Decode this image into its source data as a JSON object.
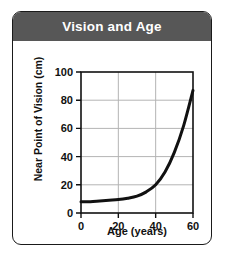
{
  "figure": {
    "title": "Vision and Age",
    "title_band_color": "#575757",
    "title_text_color": "#ffffff",
    "frame_color": "#1a1a1a",
    "background": "#ffffff"
  },
  "chart_data": {
    "type": "line",
    "title": "Vision and Age",
    "xlabel": "Age (years)",
    "ylabel": "Near Point of Vision (cm)",
    "xlim": [
      0,
      60
    ],
    "ylim": [
      0,
      100
    ],
    "xticks": [
      "0",
      "20",
      "40",
      "60"
    ],
    "yticks": [
      "0",
      "20",
      "40",
      "60",
      "80",
      "100"
    ],
    "xtick_values": [
      0,
      20,
      40,
      60
    ],
    "ytick_values": [
      0,
      20,
      40,
      60,
      80,
      100
    ],
    "grid": true,
    "grid_color": "#b4b4b4",
    "legend": null,
    "line_color": "#111111",
    "line_width": 3,
    "x": [
      0,
      5,
      10,
      15,
      20,
      25,
      30,
      35,
      40,
      45,
      50,
      55,
      60
    ],
    "y": [
      8,
      8,
      8.5,
      9,
      9.5,
      10.5,
      12,
      15,
      20,
      29,
      43,
      62,
      87
    ],
    "series": [
      {
        "name": "Near point of vision",
        "x": [
          0,
          5,
          10,
          15,
          20,
          25,
          30,
          35,
          40,
          45,
          50,
          55,
          60
        ],
        "values": [
          8,
          8,
          8.5,
          9,
          9.5,
          10.5,
          12,
          15,
          20,
          29,
          43,
          62,
          87
        ]
      }
    ]
  }
}
